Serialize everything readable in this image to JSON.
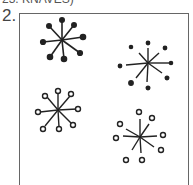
{
  "header": {
    "clipped_text": "23. KNAVES)",
    "question_number": "2."
  },
  "figure": {
    "stars": [
      {
        "id": "top-left",
        "cx": 62,
        "cy": 40,
        "endpoint": "filled",
        "connected": true
      },
      {
        "id": "top-right",
        "cx": 148,
        "cy": 63,
        "endpoint": "filled",
        "connected": false
      },
      {
        "id": "bottom-left",
        "cx": 58,
        "cy": 110,
        "endpoint": "hollow",
        "connected": true
      },
      {
        "id": "bottom-right",
        "cx": 140,
        "cy": 137,
        "endpoint": "hollow",
        "connected": false
      }
    ]
  }
}
